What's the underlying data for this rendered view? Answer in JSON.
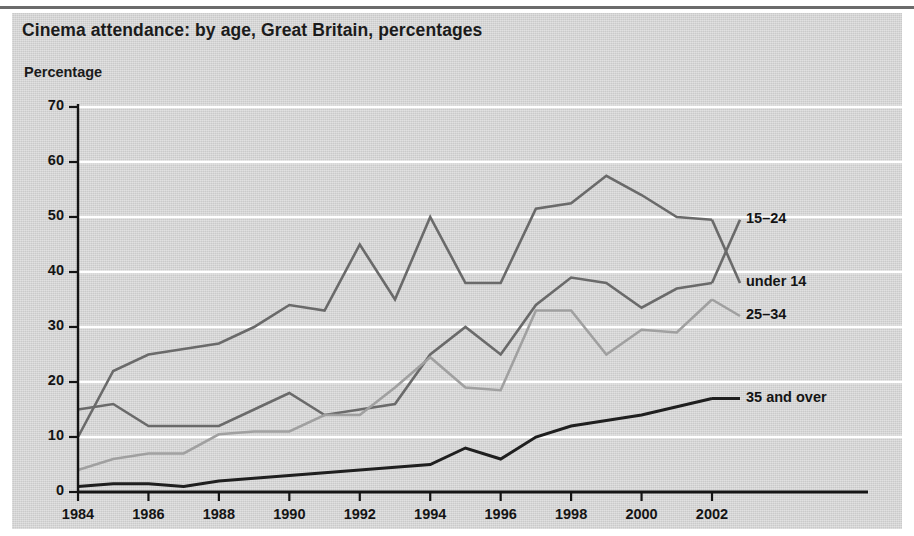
{
  "chart_data": {
    "type": "line",
    "title": "Cinema attendance: by age, Great Britain, percentages",
    "subtitle": "",
    "ylabel": "Percentage",
    "xlabel": "",
    "ylim": [
      0,
      70
    ],
    "xlim": [
      1984,
      2002
    ],
    "yticks": [
      0,
      10,
      20,
      30,
      40,
      50,
      60,
      70
    ],
    "xticks": [
      1984,
      1986,
      1988,
      1990,
      1992,
      1994,
      1996,
      1998,
      2000,
      2002
    ],
    "xtick_labels": [
      "1984",
      "1986",
      "1988",
      "1990",
      "1992",
      "1994",
      "1996",
      "1998",
      "2000",
      "2002"
    ],
    "ytick_labels": [
      "0",
      "10",
      "20",
      "30",
      "40",
      "50",
      "60",
      "70"
    ],
    "grid": "horizontal-white",
    "legend_position": "right-inline-labels",
    "x": [
      1984,
      1985,
      1986,
      1987,
      1988,
      1989,
      1990,
      1991,
      1992,
      1993,
      1994,
      1995,
      1996,
      1997,
      1998,
      1999,
      2000,
      2001,
      2002
    ],
    "series": [
      {
        "name": "15-24",
        "label": "15–24",
        "color": "#6a6a6a",
        "width": 2.6,
        "label_y_value": 49.5,
        "values": [
          15,
          16,
          12,
          12,
          12,
          15,
          18,
          14,
          15,
          16,
          25,
          30,
          25,
          34,
          39,
          38,
          33.5,
          37,
          38
        ]
      },
      {
        "name": "under 14",
        "label": "under 14",
        "color": "#6a6a6a",
        "width": 2.6,
        "label_y_value": 38,
        "values": [
          10,
          22,
          25,
          26,
          27,
          30,
          34,
          33,
          45,
          35,
          50,
          38,
          38,
          51.5,
          52.5,
          57.5,
          54,
          50,
          49.5
        ]
      },
      {
        "name": "25-34",
        "label": "25–34",
        "color": "#a0a0a0",
        "width": 2.6,
        "label_y_value": 32,
        "values": [
          4,
          6,
          7,
          7,
          10.5,
          11,
          11,
          14,
          14,
          19,
          24.5,
          19,
          18.5,
          33,
          33,
          25,
          29.5,
          29,
          35
        ]
      },
      {
        "name": "35 and over",
        "label": "35 and over",
        "color": "#1f1f1f",
        "width": 3.0,
        "label_y_value": 17,
        "values": [
          1,
          1.5,
          1.5,
          1,
          2,
          2.5,
          3,
          3.5,
          4,
          4.5,
          5,
          8,
          6,
          10,
          12,
          13,
          14,
          15.5,
          17
        ]
      }
    ],
    "series_display_order": [
      "under 14",
      "15-24",
      "25-34",
      "35 and over"
    ],
    "labels_on_plot": [
      {
        "text": "15–24",
        "value": 49.5
      },
      {
        "text": "under 14",
        "value": 38
      },
      {
        "text": "25–34",
        "value": 32
      },
      {
        "text": "35 and over",
        "value": 17
      }
    ]
  },
  "colors": {
    "panel_background": "#d8d8d8",
    "page_background": "#ffffff",
    "axis": "#141414",
    "gridline": "#ffffff",
    "text": "#141414",
    "rule": "#6b6b6b"
  }
}
